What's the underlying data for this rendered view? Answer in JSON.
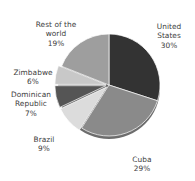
{
  "chart_data": {
    "type": "pie",
    "title": "",
    "subtitle": "",
    "xlabel": "",
    "ylabel": "",
    "legend_position": "none",
    "grid": false,
    "labels_show_percent": true,
    "categories": [
      "United States",
      "Cuba",
      "Brazil",
      "Dominican Republic",
      "Zimbabwe",
      "Rest of the world"
    ],
    "values": [
      30,
      29,
      9,
      7,
      6,
      19
    ],
    "value_unit": "%",
    "slices": [
      {
        "name": "United States",
        "label": "United States",
        "value": 30,
        "percent_text": "30%",
        "color": "#333333",
        "start_angle_deg": 0,
        "end_angle_deg": 108,
        "exploded": false
      },
      {
        "name": "Cuba",
        "label": "Cuba",
        "value": 29,
        "percent_text": "29%",
        "color": "#8a8a8a",
        "start_angle_deg": 108,
        "end_angle_deg": 212.4,
        "exploded": false
      },
      {
        "name": "Brazil",
        "label": "Brazil",
        "value": 9,
        "percent_text": "9%",
        "color": "#dcdcdc",
        "start_angle_deg": 212.4,
        "end_angle_deg": 244.8,
        "exploded": true
      },
      {
        "name": "Dominican Republic",
        "label": "Dominican\nRepublic",
        "value": 7,
        "percent_text": "7%",
        "color": "#555555",
        "start_angle_deg": 244.8,
        "end_angle_deg": 270,
        "exploded": true
      },
      {
        "name": "Zimbabwe",
        "label": "Zimbabwe",
        "value": 6,
        "percent_text": "6%",
        "color": "#c8c8c8",
        "start_angle_deg": 270,
        "end_angle_deg": 291.6,
        "exploded": true
      },
      {
        "name": "Rest of the world",
        "label": "Rest of the\nworld",
        "value": 19,
        "percent_text": "19%",
        "color": "#9e9e9e",
        "start_angle_deg": 291.6,
        "end_angle_deg": 360,
        "exploded": false
      }
    ],
    "colors": {
      "background": "#ffffff",
      "text": "#3c3c3c",
      "shadow_rim": "#6d6d6d"
    }
  },
  "labels": {
    "rest_of_world": {
      "name": "Rest of the\nworld",
      "percent": "19%"
    },
    "united_states": {
      "name": "United\nStates",
      "percent": "30%"
    },
    "zimbabwe": {
      "name": "Zimbabwe",
      "percent": "6%"
    },
    "dominican_republic": {
      "name": "Dominican\nRepublic",
      "percent": "7%"
    },
    "brazil": {
      "name": "Brazil",
      "percent": "9%"
    },
    "cuba": {
      "name": "Cuba",
      "percent": "29%"
    }
  }
}
